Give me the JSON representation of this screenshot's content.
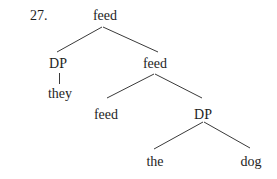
{
  "example_number": "27.",
  "tree": {
    "root": {
      "label": "feed"
    },
    "dp_subject": {
      "label": "DP"
    },
    "pronoun": {
      "label": "they"
    },
    "feed_intermediate": {
      "label": "feed"
    },
    "feed_head": {
      "label": "feed"
    },
    "dp_object": {
      "label": "DP"
    },
    "determiner": {
      "label": "the"
    },
    "noun": {
      "label": "dog"
    }
  },
  "colors": {
    "line": "#3a3a3a",
    "text": "#1e1e1e",
    "background": "#ffffff"
  }
}
